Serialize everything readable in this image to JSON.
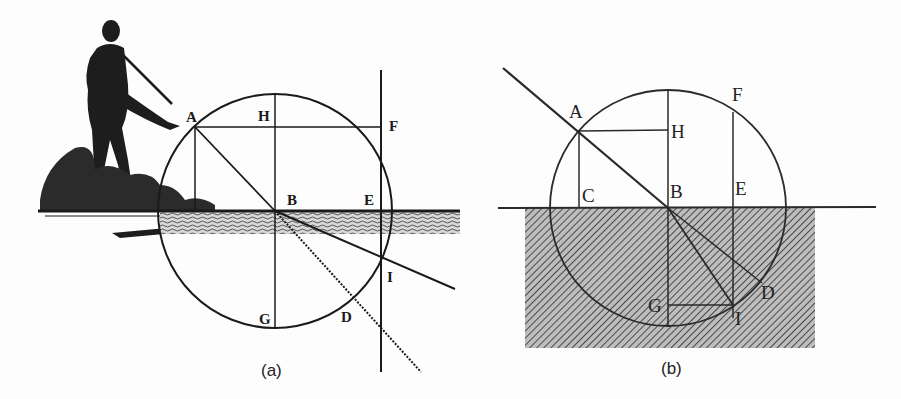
{
  "figure_a": {
    "caption": "(a)",
    "labels": {
      "A": "A",
      "H": "H",
      "F": "F",
      "B": "B",
      "E": "E",
      "I": "I",
      "G": "G",
      "D": "D"
    },
    "illustration": "woodcut-figure-with-staff-on-shore"
  },
  "figure_b": {
    "caption": "(b)",
    "labels": {
      "A": "A",
      "H": "H",
      "F": "F",
      "C": "C",
      "B": "B",
      "E": "E",
      "D": "D",
      "G": "G",
      "I": "I"
    },
    "medium": "hatched-water-region"
  },
  "colors": {
    "ink": "#1a1a1a",
    "paper": "#fdfdfd",
    "hatch": "#555555"
  }
}
